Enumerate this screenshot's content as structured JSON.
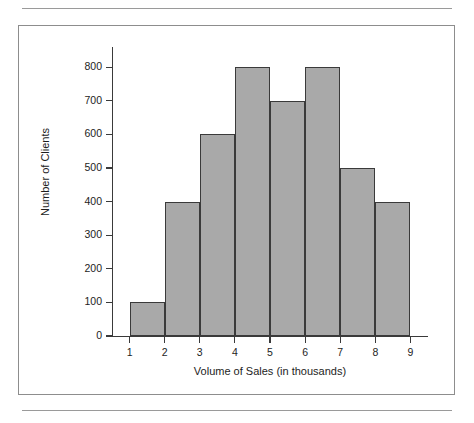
{
  "figure": {
    "background_color": "#ffffff",
    "border_color": "#8d8d8d",
    "rule_color": "#9a9a9a"
  },
  "chart_data": {
    "type": "bar",
    "title": "",
    "subtitle": "",
    "xlabel": "Volume of Sales (in thousands)",
    "ylabel": "Number of Clients",
    "bin_edges": [
      1,
      2,
      3,
      4,
      5,
      6,
      7,
      8,
      9
    ],
    "categories": [
      "1-2",
      "2-3",
      "3-4",
      "4-5",
      "5-6",
      "6-7",
      "7-8",
      "8-9"
    ],
    "values": [
      100,
      400,
      600,
      800,
      700,
      800,
      500,
      400
    ],
    "bars": [
      {
        "x_start": 1,
        "x_end": 2,
        "value": 100
      },
      {
        "x_start": 2,
        "x_end": 3,
        "value": 400
      },
      {
        "x_start": 3,
        "x_end": 4,
        "value": 600
      },
      {
        "x_start": 4,
        "x_end": 5,
        "value": 800
      },
      {
        "x_start": 5,
        "x_end": 6,
        "value": 700
      },
      {
        "x_start": 6,
        "x_end": 7,
        "value": 800
      },
      {
        "x_start": 7,
        "x_end": 8,
        "value": 500
      },
      {
        "x_start": 8,
        "x_end": 9,
        "value": 400
      }
    ],
    "xlim": [
      0.5,
      9.5
    ],
    "ylim": [
      0,
      860
    ],
    "ytick_labels": [
      "0",
      "100",
      "200",
      "300",
      "400",
      "500",
      "600",
      "700",
      "800"
    ],
    "ytick_values": [
      0,
      100,
      200,
      300,
      400,
      500,
      600,
      700,
      800
    ],
    "xtick_labels": [
      "1",
      "2",
      "3",
      "4",
      "5",
      "6",
      "7",
      "8",
      "9"
    ],
    "xtick_values": [
      1,
      2,
      3,
      4,
      5,
      6,
      7,
      8,
      9
    ],
    "grid": false,
    "legend": false,
    "bar_fill_color": "#a9a9a9",
    "bar_edge_color": "#3a3a3a",
    "axis_color": "#3a3a3a",
    "text_color": "#1d1d1d"
  }
}
